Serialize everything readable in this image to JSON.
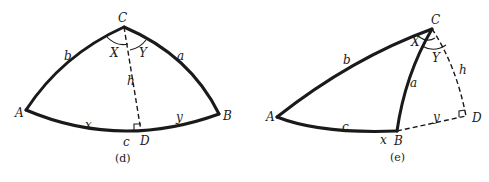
{
  "figures": [
    {
      "id": "d",
      "caption": "(d)",
      "vertices": {
        "A": "A",
        "B": "B",
        "C": "C",
        "D": "D"
      },
      "sides": {
        "a": "a",
        "b": "b",
        "c": "c",
        "h": "h",
        "x": "x",
        "y": "y"
      },
      "angles": {
        "X": "X",
        "Y": "Y"
      },
      "right_angle_at": "D",
      "description": "Spherical triangle ABC with altitude h from C to D on side c, D between A and B"
    },
    {
      "id": "e",
      "caption": "(e)",
      "vertices": {
        "A": "A",
        "B": "B",
        "C": "C",
        "D": "D"
      },
      "sides": {
        "a": "a",
        "b": "b",
        "c": "c",
        "h": "h",
        "x": "x",
        "y": "y"
      },
      "angles": {
        "X": "X",
        "Y": "Y"
      },
      "right_angle_at": "D",
      "description": "Spherical triangle ABC with altitude h from C to D on extension of side c beyond B"
    }
  ],
  "colors": {
    "ink": "#1a1a1a",
    "background": "#ffffff"
  }
}
